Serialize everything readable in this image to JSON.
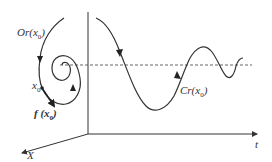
{
  "diagram": {
    "colors": {
      "stroke": "#333333",
      "dashed": "#555555",
      "background": "#ffffff"
    },
    "labels": {
      "orbit": "Or(x",
      "orbit_sub": "0",
      "orbit_close": ")",
      "x0": "x",
      "x0_sub": "0",
      "vector_field": "f (x",
      "vector_field_sub": "0",
      "vector_field_close": ")",
      "curve": "Cr(x",
      "curve_sub": "0",
      "curve_close": ")",
      "time_axis": "t",
      "state_axis": "X"
    }
  }
}
